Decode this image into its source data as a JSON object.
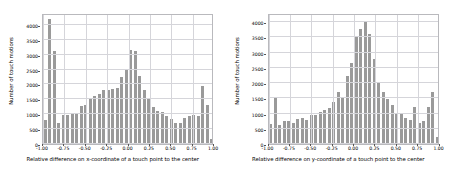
{
  "figure": {
    "background": "#ffffff",
    "bar_color": "#9a9a9a",
    "grid_color": "#d5d5da",
    "axis_color": "#b9b9bd"
  },
  "chart_data": [
    {
      "type": "bar",
      "title": "",
      "xlabel": "Relative difference on x-coordinate of a touch point to the center",
      "ylabel": "Number of touch motions",
      "xlim": [
        -1.0,
        1.0
      ],
      "ylim": [
        0,
        4400
      ],
      "grid": true,
      "legend": "none",
      "xticks": [
        -1.0,
        -0.75,
        -0.5,
        -0.25,
        0.0,
        0.25,
        0.5,
        0.75,
        1.0
      ],
      "xticklabels": [
        "-1.00",
        "-0.75",
        "-0.50",
        "-0.25",
        "0.00",
        "0.25",
        "0.50",
        "0.75",
        "1.00"
      ],
      "yticks": [
        0,
        500,
        1000,
        1500,
        2000,
        2500,
        3000,
        3500,
        4000
      ],
      "yticklabels": [
        "0",
        "500",
        "1000",
        "1500",
        "2000",
        "2500",
        "3000",
        "3500",
        "4000"
      ],
      "bin_edges": [
        -1.0,
        -0.95,
        -0.9,
        -0.85,
        -0.8,
        -0.75,
        -0.7,
        -0.65,
        -0.6,
        -0.55,
        -0.5,
        -0.45,
        -0.4,
        -0.35,
        -0.3,
        -0.25,
        -0.2,
        -0.15,
        -0.1,
        -0.05,
        0.0,
        0.05,
        0.1,
        0.15,
        0.2,
        0.25,
        0.3,
        0.35,
        0.4,
        0.45,
        0.5,
        0.55,
        0.6,
        0.65,
        0.7,
        0.75,
        0.8,
        0.85,
        0.9,
        0.95,
        1.0
      ],
      "categories": [
        "-0.975",
        "-0.925",
        "-0.875",
        "-0.825",
        "-0.775",
        "-0.725",
        "-0.675",
        "-0.625",
        "-0.575",
        "-0.525",
        "-0.475",
        "-0.425",
        "-0.375",
        "-0.325",
        "-0.275",
        "-0.225",
        "-0.175",
        "-0.125",
        "-0.075",
        "-0.025",
        "0.025",
        "0.075",
        "0.125",
        "0.175",
        "0.225",
        "0.275",
        "0.325",
        "0.375",
        "0.425",
        "0.475",
        "0.525",
        "0.575",
        "0.625",
        "0.675",
        "0.725",
        "0.775",
        "0.825",
        "0.875",
        "0.925",
        "0.975"
      ],
      "values": [
        790,
        4200,
        3120,
        720,
        980,
        990,
        1000,
        1000,
        1280,
        1300,
        1500,
        1600,
        1680,
        1820,
        1830,
        1850,
        1880,
        2250,
        2520,
        3170,
        3110,
        2300,
        1830,
        1530,
        1230,
        1110,
        1070,
        940,
        840,
        720,
        720,
        870,
        950,
        980,
        950,
        1940,
        1300,
        160
      ]
    },
    {
      "type": "bar",
      "title": "",
      "xlabel": "Relative difference on y-coordinate of a touch point to the center",
      "ylabel": "Number of touch motions",
      "xlim": [
        -1.0,
        1.0
      ],
      "ylim": [
        0,
        4300
      ],
      "grid": true,
      "legend": "none",
      "xticks": [
        -1.0,
        -0.75,
        -0.5,
        -0.25,
        0.0,
        0.25,
        0.5,
        0.75,
        1.0
      ],
      "xticklabels": [
        "-1.00",
        "-0.75",
        "-0.50",
        "-0.25",
        "0.00",
        "0.25",
        "0.50",
        "0.75",
        "1.00"
      ],
      "yticks": [
        0,
        500,
        1000,
        1500,
        2000,
        2500,
        3000,
        3500,
        4000
      ],
      "yticklabels": [
        "0",
        "500",
        "1000",
        "1500",
        "2000",
        "2500",
        "3000",
        "3500",
        "4000"
      ],
      "categories": [
        "-0.975",
        "-0.925",
        "-0.875",
        "-0.825",
        "-0.775",
        "-0.725",
        "-0.675",
        "-0.625",
        "-0.575",
        "-0.525",
        "-0.475",
        "-0.425",
        "-0.375",
        "-0.325",
        "-0.275",
        "-0.225",
        "-0.175",
        "-0.125",
        "-0.075",
        "-0.025",
        "0.025",
        "0.075",
        "0.125",
        "0.175",
        "0.225",
        "0.275",
        "0.325",
        "0.375",
        "0.425",
        "0.475",
        "0.525",
        "0.575",
        "0.625",
        "0.675",
        "0.725",
        "0.775",
        "0.825",
        "0.875",
        "0.925",
        "0.975"
      ],
      "values": [
        650,
        1520,
        620,
        760,
        760,
        700,
        830,
        840,
        790,
        960,
        940,
        1060,
        1120,
        1180,
        1390,
        1710,
        1500,
        2230,
        2650,
        3500,
        3760,
        4050,
        3620,
        2800,
        2050,
        1700,
        1490,
        1290,
        1000,
        980,
        870,
        780,
        1220,
        700,
        740,
        1210,
        1700,
        230
      ]
    }
  ],
  "panels": [
    {
      "name": "x-coordinate-histogram",
      "ylabel": "Number of touch motions",
      "xlabel": "Relative difference on x-coordinate of a touch point to the center"
    },
    {
      "name": "y-coordinate-histogram",
      "ylabel": "Number of touch motions",
      "xlabel": "Relative difference on y-coordinate of a touch point to the center"
    }
  ]
}
